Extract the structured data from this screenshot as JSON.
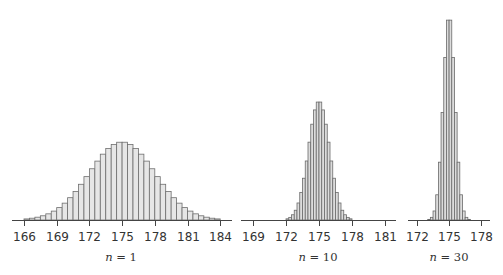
{
  "chart_data": [
    {
      "type": "bar",
      "title": "",
      "label": "n = 1",
      "n": 1,
      "xlabel": "n = 1",
      "ylabel": "",
      "xlim": [
        165,
        185
      ],
      "bin_width": 0.5,
      "bin_start": 166,
      "x_ticks": [
        166,
        169,
        172,
        175,
        178,
        181,
        184
      ],
      "grid": false,
      "values": [
        0.014,
        0.023,
        0.036,
        0.054,
        0.079,
        0.114,
        0.159,
        0.216,
        0.286,
        0.366,
        0.458,
        0.556,
        0.657,
        0.755,
        0.844,
        0.917,
        0.969,
        0.997,
        0.997,
        0.969,
        0.917,
        0.844,
        0.755,
        0.657,
        0.556,
        0.458,
        0.366,
        0.286,
        0.216,
        0.159,
        0.114,
        0.079,
        0.054,
        0.036,
        0.023,
        0.014
      ],
      "layout": {
        "x0_px": 24,
        "px_per_unit": 10.9,
        "axis_left": 12,
        "axis_right": 232,
        "baseline_y": 220,
        "peak_px": 78,
        "label_x": 121
      },
      "fill": "#e6e6e6",
      "stroke": "#6e6e6e"
    },
    {
      "type": "bar",
      "title": "",
      "label": "n = 10",
      "n": 10,
      "xlabel": "n = 10",
      "ylabel": "",
      "xlim": [
        167.8,
        182.2
      ],
      "bin_width": 0.25,
      "bin_start": 172,
      "x_ticks": [
        169,
        172,
        175,
        178,
        181
      ],
      "grid": false,
      "values": [
        0.01,
        0.022,
        0.044,
        0.082,
        0.143,
        0.232,
        0.351,
        0.496,
        0.654,
        0.805,
        0.925,
        0.991,
        0.991,
        0.925,
        0.805,
        0.654,
        0.496,
        0.351,
        0.232,
        0.143,
        0.082,
        0.044,
        0.022,
        0.01
      ],
      "layout": {
        "x0_px": 253,
        "tick0": 169,
        "px_per_unit": 11.0,
        "axis_left": 241,
        "axis_right": 396,
        "baseline_y": 220,
        "peak_px": 119,
        "label_x": 318
      },
      "fill": "#dcdcdc",
      "stroke": "#6a6a6a"
    },
    {
      "type": "bar",
      "title": "",
      "label": "n = 30",
      "n": 30,
      "xlabel": "n = 30",
      "ylabel": "",
      "xlim": [
        171.1,
        178.9
      ],
      "bin_width": 0.25,
      "bin_start": 172.5,
      "x_ticks": [
        172,
        175,
        178
      ],
      "grid": false,
      "values": [
        0.0001,
        0.0006,
        0.003,
        0.013,
        0.044,
        0.123,
        0.282,
        0.524,
        0.793,
        0.975,
        0.975,
        0.793,
        0.524,
        0.282,
        0.123,
        0.044,
        0.013,
        0.003,
        0.0006,
        0.0001
      ],
      "layout": {
        "x0_px": 417,
        "tick0": 172,
        "px_per_unit": 10.7,
        "axis_left": 408,
        "axis_right": 490,
        "baseline_y": 220,
        "peak_px": 205,
        "label_x": 449
      },
      "fill": "#dcdcdc",
      "stroke": "#6a6a6a"
    }
  ],
  "labels": {
    "panel1": {
      "var": "n",
      "eq": " = ",
      "value": "1"
    },
    "panel2": {
      "var": "n",
      "eq": " = ",
      "value": "10"
    },
    "panel3": {
      "var": "n",
      "eq": " = ",
      "value": "30"
    }
  }
}
